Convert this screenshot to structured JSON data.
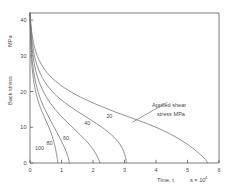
{
  "chart_data": {
    "type": "line",
    "title": "",
    "xlabel": "Time, t",
    "xlabel_units": "s × 10",
    "xlabel_exponent": "4",
    "ylabel": "Back stress",
    "ylabel_units": "MPa",
    "xlim": [
      0,
      6
    ],
    "ylim": [
      0,
      42
    ],
    "xticks": [
      0,
      1,
      2,
      3,
      4,
      5,
      6
    ],
    "xtick_labels": [
      "0",
      "1",
      "2",
      "3",
      "4",
      "5",
      "6"
    ],
    "yticks": [
      0,
      10,
      20,
      30,
      40
    ],
    "ytick_labels": [
      "0",
      "10",
      "20",
      "30",
      "40"
    ],
    "grid": false,
    "legend_position": "inline-curve-labels",
    "annotation": {
      "line1": "Applied  shear",
      "line2": "stress   MPa",
      "arrow_from_x": 4.35,
      "arrow_from_y": 17.0,
      "arrow_to_x": 3.25,
      "arrow_to_y": 11.4
    },
    "series": [
      {
        "name": "100",
        "label": "100",
        "label_x": 0.3,
        "label_y": 3.6,
        "points": [
          [
            0.0,
            42.0
          ],
          [
            0.01,
            38.0
          ],
          [
            0.02,
            34.5
          ],
          [
            0.032,
            31.5
          ],
          [
            0.05,
            28.6
          ],
          [
            0.075,
            26.0
          ],
          [
            0.11,
            23.4
          ],
          [
            0.15,
            21.2
          ],
          [
            0.2,
            19.2
          ],
          [
            0.26,
            17.3
          ],
          [
            0.33,
            15.5
          ],
          [
            0.4,
            14.0
          ],
          [
            0.47,
            12.6
          ],
          [
            0.54,
            11.2
          ],
          [
            0.61,
            9.8
          ],
          [
            0.67,
            8.4
          ],
          [
            0.72,
            7.0
          ],
          [
            0.77,
            5.5
          ],
          [
            0.81,
            4.0
          ],
          [
            0.84,
            2.6
          ],
          [
            0.865,
            1.3
          ],
          [
            0.88,
            0.0
          ]
        ]
      },
      {
        "name": "80",
        "label": "80",
        "label_x": 0.62,
        "label_y": 5.0,
        "points": [
          [
            0.0,
            42.0
          ],
          [
            0.012,
            38.4
          ],
          [
            0.025,
            35.2
          ],
          [
            0.04,
            32.4
          ],
          [
            0.065,
            29.6
          ],
          [
            0.095,
            27.1
          ],
          [
            0.14,
            24.4
          ],
          [
            0.195,
            22.0
          ],
          [
            0.26,
            19.8
          ],
          [
            0.34,
            17.7
          ],
          [
            0.43,
            15.8
          ],
          [
            0.53,
            14.0
          ],
          [
            0.63,
            12.3
          ],
          [
            0.73,
            10.6
          ],
          [
            0.83,
            9.0
          ],
          [
            0.93,
            7.3
          ],
          [
            1.02,
            5.7
          ],
          [
            1.1,
            4.2
          ],
          [
            1.165,
            2.8
          ],
          [
            1.215,
            1.5
          ],
          [
            1.25,
            0.0
          ]
        ]
      },
      {
        "name": "60",
        "label": "60",
        "label_x": 1.14,
        "label_y": 6.4,
        "points": [
          [
            0.0,
            42.0
          ],
          [
            0.015,
            38.8
          ],
          [
            0.032,
            35.8
          ],
          [
            0.055,
            33.0
          ],
          [
            0.09,
            30.3
          ],
          [
            0.135,
            27.8
          ],
          [
            0.2,
            25.2
          ],
          [
            0.285,
            22.8
          ],
          [
            0.39,
            20.6
          ],
          [
            0.51,
            18.6
          ],
          [
            0.65,
            16.7
          ],
          [
            0.81,
            14.9
          ],
          [
            0.99,
            13.1
          ],
          [
            1.18,
            11.4
          ],
          [
            1.38,
            9.7
          ],
          [
            1.58,
            8.0
          ],
          [
            1.76,
            6.4
          ],
          [
            1.92,
            4.8
          ],
          [
            2.04,
            3.3
          ],
          [
            2.13,
            1.9
          ],
          [
            2.19,
            0.8
          ],
          [
            2.22,
            0.0
          ]
        ]
      },
      {
        "name": "40",
        "label": "40",
        "label_x": 1.82,
        "label_y": 10.6,
        "points": [
          [
            0.0,
            42.0
          ],
          [
            0.018,
            39.2
          ],
          [
            0.04,
            36.4
          ],
          [
            0.07,
            33.8
          ],
          [
            0.115,
            31.2
          ],
          [
            0.175,
            28.8
          ],
          [
            0.265,
            26.3
          ],
          [
            0.385,
            24.0
          ],
          [
            0.54,
            21.8
          ],
          [
            0.73,
            19.8
          ],
          [
            0.96,
            17.9
          ],
          [
            1.23,
            16.1
          ],
          [
            1.53,
            14.3
          ],
          [
            1.84,
            12.6
          ],
          [
            2.15,
            10.8
          ],
          [
            2.44,
            9.0
          ],
          [
            2.68,
            7.1
          ],
          [
            2.86,
            5.2
          ],
          [
            2.97,
            3.3
          ],
          [
            3.03,
            1.6
          ],
          [
            3.06,
            0.0
          ]
        ]
      },
      {
        "name": "20",
        "label": "20",
        "label_x": 2.52,
        "label_y": 12.6,
        "points": [
          [
            0.0,
            42.0
          ],
          [
            0.022,
            39.6
          ],
          [
            0.05,
            37.0
          ],
          [
            0.09,
            34.6
          ],
          [
            0.15,
            32.2
          ],
          [
            0.235,
            29.9
          ],
          [
            0.36,
            27.6
          ],
          [
            0.53,
            25.4
          ],
          [
            0.76,
            23.3
          ],
          [
            1.05,
            21.3
          ],
          [
            1.4,
            19.4
          ],
          [
            1.8,
            17.6
          ],
          [
            2.25,
            15.9
          ],
          [
            2.73,
            14.2
          ],
          [
            3.23,
            12.6
          ],
          [
            3.72,
            11.0
          ],
          [
            4.18,
            9.3
          ],
          [
            4.58,
            7.5
          ],
          [
            4.92,
            5.7
          ],
          [
            5.2,
            3.9
          ],
          [
            5.42,
            2.3
          ],
          [
            5.57,
            1.0
          ],
          [
            5.64,
            0.0
          ]
        ]
      }
    ]
  }
}
